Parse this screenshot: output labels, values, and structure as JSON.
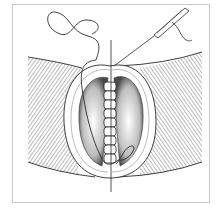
{
  "figure": {
    "kind": "surgical-suture-illustration",
    "colors": {
      "background": "#ffffff",
      "frame": "#c8c8c8",
      "ink": "#2a2a2a",
      "stipple": "#6a6a6a"
    },
    "labels": []
  }
}
